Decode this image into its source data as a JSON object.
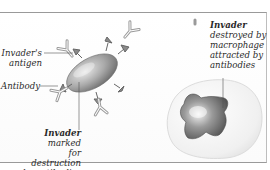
{
  "diagram": {
    "type": "illustration",
    "labels": {
      "antigen": {
        "line1": "Invader's",
        "line2": "antigen"
      },
      "antibody": "Antibody",
      "marked": {
        "bold": "Invader",
        "rest1": " marked",
        "line2": "for destruction",
        "line3": "by antibodies"
      },
      "destroyed": {
        "bold": "Invader",
        "line2": "destroyed by",
        "line3": "macrophage",
        "line4": "attracted by",
        "line5": "antibodies"
      }
    },
    "elements": [
      "invader-cell",
      "antibodies",
      "macrophage",
      "engulfed-invader"
    ],
    "colors": {
      "frame": "#9a9a9a",
      "cell": "#9b9b9b",
      "text": "#2a2a2a",
      "macrophage": "#f1f1f1"
    }
  }
}
